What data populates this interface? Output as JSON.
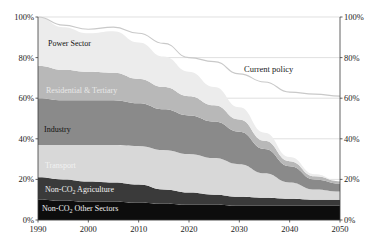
{
  "chart_data": {
    "type": "area",
    "title": "",
    "subtitle": "",
    "xlabel": "",
    "ylabel": "",
    "stacked": true,
    "percent_stacked": false,
    "grid": true,
    "legend": "inline-band-labels",
    "xlim": [
      1990,
      2050
    ],
    "ylim": [
      0,
      100
    ],
    "x": [
      1990,
      1995,
      2000,
      2005,
      2010,
      2015,
      2020,
      2025,
      2030,
      2035,
      2040,
      2045,
      2050
    ],
    "xticks": [
      "1990",
      "2000",
      "2010",
      "2020",
      "2030",
      "2040",
      "2050"
    ],
    "xtick_values": [
      1990,
      2000,
      2010,
      2020,
      2030,
      2040,
      2050
    ],
    "yticks_left": [
      "0%",
      "20%",
      "40%",
      "60%",
      "80%",
      "100%"
    ],
    "yticks_right": [
      "0%",
      "20%",
      "40%",
      "60%",
      "80%",
      "100%"
    ],
    "ytick_values": [
      0,
      20,
      40,
      60,
      80,
      100
    ],
    "series": [
      {
        "name": "Non-CO2 Other Sectors",
        "label": "Non-CO",
        "label_sub": "2",
        "label_tail": " Other Sectors",
        "color": "#0d0d0d",
        "order": 1,
        "values": [
          10,
          9.5,
          9,
          9,
          8.5,
          8,
          7.5,
          7.5,
          7,
          7,
          7,
          7,
          7
        ]
      },
      {
        "name": "Non-CO2 Agriculture",
        "label": "Non-CO",
        "label_sub": "2",
        "label_tail": " Agriculture",
        "color": "#3a3a3a",
        "order": 2,
        "values": [
          11,
          10.5,
          10,
          9.5,
          9,
          7,
          6,
          5,
          4.5,
          4,
          3.5,
          3,
          3
        ]
      },
      {
        "name": "Transport",
        "label": "Transport",
        "label_sub": "",
        "label_tail": "",
        "color": "#d8d8d8",
        "order": 3,
        "values": [
          16,
          17,
          18,
          18.5,
          19,
          19.5,
          19,
          18,
          16,
          12,
          8,
          5,
          4
        ]
      },
      {
        "name": "Industry",
        "label": "Industry",
        "label_sub": "",
        "label_tail": "",
        "color": "#8a8a8a",
        "order": 4,
        "values": [
          23,
          22,
          22,
          22,
          21,
          20,
          19,
          18,
          16,
          12,
          8,
          5,
          4
        ]
      },
      {
        "name": "Residential & Tertiary",
        "label": "Residential & Tertiary",
        "label_sub": "",
        "label_tail": "",
        "color": "#b8b8b8",
        "order": 5,
        "values": [
          16,
          15,
          14,
          13.5,
          12,
          11,
          9.5,
          8,
          6,
          4,
          2.5,
          1.5,
          1
        ]
      },
      {
        "name": "Power Sector",
        "label": "Power Sector",
        "label_sub": "",
        "label_tail": "",
        "color": "#ececec",
        "order": 6,
        "values": [
          24,
          21,
          19,
          20.5,
          18,
          15,
          12,
          9,
          6,
          4,
          2,
          1,
          0
        ]
      }
    ],
    "reference_line": {
      "name": "Current policy",
      "label": "Current policy",
      "color": "#c9c9c9",
      "x": [
        1990,
        1995,
        2000,
        2005,
        2010,
        2015,
        2020,
        2025,
        2030,
        2035,
        2040,
        2045,
        2050
      ],
      "values": [
        100,
        96,
        94,
        95,
        92,
        87,
        80,
        78,
        72,
        68,
        63,
        62,
        61
      ]
    },
    "totals": [
      100,
      95,
      92,
      93,
      87.5,
      80.5,
      73.5,
      65.5,
      55.5,
      43,
      31,
      22.5,
      19
    ]
  }
}
